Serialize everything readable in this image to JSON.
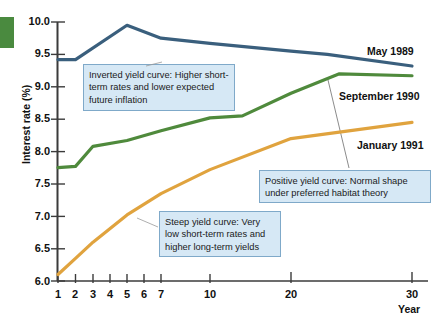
{
  "chart_data": {
    "type": "line",
    "title": "",
    "xlabel": "Year",
    "ylabel": "Interest rate (%)",
    "ylim": [
      6.0,
      10.0
    ],
    "ytick_labels": [
      "6.0",
      "6.5",
      "7.0",
      "7.5",
      "8.0",
      "8.5",
      "9.0",
      "9.5",
      "10.0"
    ],
    "ytick_values": [
      6.0,
      6.5,
      7.0,
      7.5,
      8.0,
      8.5,
      9.0,
      9.5,
      10.0
    ],
    "xtick_labels": [
      "1",
      "2",
      "3",
      "4",
      "5",
      "6",
      "7",
      "10",
      "20",
      "30"
    ],
    "xtick_values": [
      1,
      2,
      3,
      4,
      5,
      6,
      7,
      10,
      20,
      30
    ],
    "grid": false,
    "legend_position": "inline-right",
    "series": [
      {
        "name": "May 1989",
        "color": "#3a5f7d",
        "x": [
          1,
          2,
          5,
          7,
          10,
          20,
          23,
          30
        ],
        "values": [
          9.42,
          9.42,
          9.95,
          9.75,
          9.67,
          9.55,
          9.5,
          9.32
        ]
      },
      {
        "name": "September 1990",
        "color": "#4f8a3c",
        "x": [
          1,
          2,
          3,
          5,
          7,
          10,
          14,
          20,
          24,
          30
        ],
        "values": [
          7.75,
          7.77,
          8.08,
          8.17,
          8.32,
          8.52,
          8.55,
          8.9,
          9.2,
          9.17
        ]
      },
      {
        "name": "January 1991",
        "color": "#e0a33e",
        "x": [
          1,
          2,
          3,
          5,
          7,
          10,
          20,
          30
        ],
        "values": [
          6.1,
          6.35,
          6.6,
          7.02,
          7.35,
          7.72,
          8.2,
          8.45
        ]
      }
    ],
    "annotations": [
      {
        "id": "inverted",
        "text": "Inverted yield curve:  Higher short-term rates and lower expected future inflation"
      },
      {
        "id": "positive",
        "text": "Positive yield curve:  Normal shape under preferred habitat theory"
      },
      {
        "id": "steep",
        "text": "Steep yield curve:  Very low short-term rates and higher long-term yields"
      }
    ]
  },
  "colors": {
    "may_1989": "#3a5f7d",
    "september_1990": "#4f8a3c",
    "january_1991": "#e0a33e",
    "callout_fill": "#d6e8f5",
    "callout_border": "#7fa9c9",
    "axis": "#3b3b3b",
    "tab": "#4a8a3f"
  }
}
